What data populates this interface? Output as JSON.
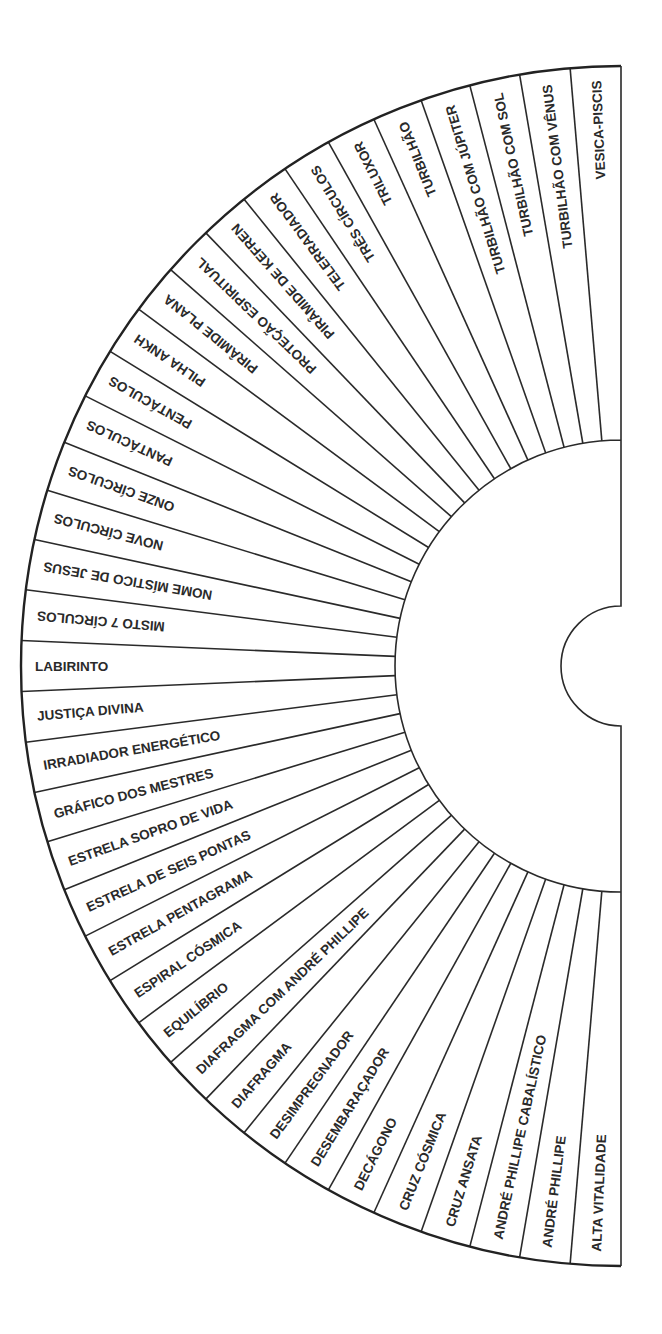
{
  "diagram": {
    "type": "semicircular radiesthesia chart (fan of labeled sectors)",
    "geometry": {
      "center_x": 621,
      "center_y": 666,
      "outer_radius": 600,
      "inner_radius": 226,
      "notch_radius": 60,
      "stroke_color": "#2a2a2a",
      "background": "#ffffff"
    },
    "sectors": [
      "VESICA-PISCIS",
      "TURBILHÃO COM VÊNUS",
      "TURBILHÃO COM SOL",
      "TURBILHÃO COM JÚPITER",
      "TURBILHÃO",
      "TRILUXOR",
      "TRÊS CÍRCULOS",
      "TELERRADIADOR",
      "PIRÂMIDE DE KEFREN",
      "PROTEÇÃO ESPIRITUAL",
      "PIRÂMIDE PLANA",
      "PILHA ANKH",
      "PENTÁCULOS",
      "PANTÁCULOS",
      "ONZE CÍRCULOS",
      "NOVE CÍRCULOS",
      "NOME MÍSTICO DE JESUS",
      "MISTO 7 CÍRCULOS",
      "LABIRINTO",
      "JUSTIÇA DIVINA",
      "IRRADIADOR ENERGÉTICO",
      "GRÁFICO DOS MESTRES",
      "ESTRELA SOPRO DE VIDA",
      "ESTRELA DE SEIS PONTAS",
      "ESTRELA PENTAGRAMA",
      "ESPIRAL CÓSMICA",
      "EQUILÍBRIO",
      "DIAFRAGMA COM ANDRÉ PHILLIPE",
      "DIAFRAGMA",
      "DESIMPREGNADOR",
      "DESEMBARAÇADOR",
      "DECÁGONO",
      "CRUZ CÓSMICA",
      "CRUZ ANSATA",
      "ANDRÉ PHILLIPE CABALÍSTICO",
      "ANDRÉ PHILLIPE",
      "ALTA VITALIDADE"
    ]
  }
}
